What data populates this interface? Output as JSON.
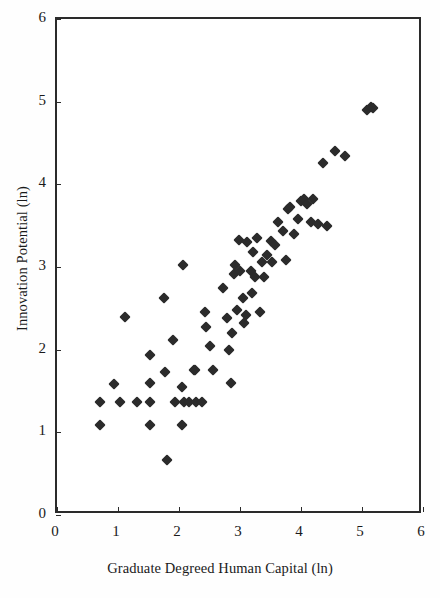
{
  "chart_data": {
    "type": "scatter",
    "title": "",
    "xlabel": "Graduate Degreed Human Capital (ln)",
    "ylabel": "Innovation Potential (ln)",
    "xlim": [
      0,
      6
    ],
    "ylim": [
      0,
      6
    ],
    "xticks": [
      0,
      1,
      2,
      3,
      4,
      5,
      6
    ],
    "yticks": [
      0,
      1,
      2,
      3,
      4,
      5,
      6
    ],
    "xtick_labels": [
      "0",
      "1",
      "2",
      "3",
      "4",
      "5",
      "6"
    ],
    "ytick_labels": [
      "0",
      "1",
      "2",
      "3",
      "4",
      "5",
      "6"
    ],
    "grid": false,
    "legend": null,
    "marker": "diamond",
    "marker_color": "#2b2b2b",
    "n_points": 74,
    "points": [
      [
        0.7,
        1.37
      ],
      [
        0.7,
        1.09
      ],
      [
        0.93,
        1.58
      ],
      [
        1.03,
        1.37
      ],
      [
        1.11,
        2.39
      ],
      [
        1.31,
        1.37
      ],
      [
        1.52,
        1.93
      ],
      [
        1.52,
        1.6
      ],
      [
        1.52,
        1.37
      ],
      [
        1.52,
        1.09
      ],
      [
        1.75,
        2.63
      ],
      [
        1.77,
        1.73
      ],
      [
        1.8,
        0.67
      ],
      [
        1.9,
        2.12
      ],
      [
        1.93,
        1.37
      ],
      [
        2.05,
        1.55
      ],
      [
        2.05,
        1.09
      ],
      [
        2.07,
        3.02
      ],
      [
        2.08,
        1.37
      ],
      [
        2.17,
        1.37
      ],
      [
        2.25,
        1.76
      ],
      [
        2.26,
        1.76
      ],
      [
        2.28,
        1.37
      ],
      [
        2.38,
        1.37
      ],
      [
        2.42,
        2.45
      ],
      [
        2.45,
        2.28
      ],
      [
        2.5,
        2.05
      ],
      [
        2.55,
        1.75
      ],
      [
        2.72,
        2.75
      ],
      [
        2.79,
        2.38
      ],
      [
        2.82,
        2.0
      ],
      [
        2.85,
        1.6
      ],
      [
        2.87,
        2.2
      ],
      [
        2.9,
        2.92
      ],
      [
        2.92,
        3.02
      ],
      [
        2.95,
        2.48
      ],
      [
        2.98,
        3.33
      ],
      [
        3.0,
        2.95
      ],
      [
        3.05,
        2.62
      ],
      [
        3.07,
        2.32
      ],
      [
        3.1,
        2.42
      ],
      [
        3.12,
        3.3
      ],
      [
        3.18,
        2.95
      ],
      [
        3.2,
        2.68
      ],
      [
        3.22,
        3.18
      ],
      [
        3.25,
        2.88
      ],
      [
        3.28,
        3.35
      ],
      [
        3.32,
        2.45
      ],
      [
        3.36,
        3.06
      ],
      [
        3.4,
        2.88
      ],
      [
        3.44,
        3.14
      ],
      [
        3.5,
        3.32
      ],
      [
        3.53,
        3.06
      ],
      [
        3.58,
        3.27
      ],
      [
        3.62,
        3.55
      ],
      [
        3.7,
        3.44
      ],
      [
        3.75,
        3.08
      ],
      [
        3.78,
        3.7
      ],
      [
        3.82,
        3.72
      ],
      [
        3.88,
        3.4
      ],
      [
        3.95,
        3.58
      ],
      [
        4.0,
        3.8
      ],
      [
        4.05,
        3.82
      ],
      [
        4.1,
        3.76
      ],
      [
        4.16,
        3.55
      ],
      [
        4.2,
        3.82
      ],
      [
        4.28,
        3.52
      ],
      [
        4.36,
        4.26
      ],
      [
        4.42,
        3.5
      ],
      [
        4.55,
        4.4
      ],
      [
        4.72,
        4.34
      ],
      [
        5.08,
        4.9
      ],
      [
        5.14,
        4.93
      ],
      [
        5.18,
        4.92
      ]
    ]
  },
  "axes": {
    "x_axis_label": "Graduate Degreed Human Capital (ln)",
    "y_axis_label": "Innovation Potential (ln)"
  },
  "colors": {
    "marker": "#2b2b2b",
    "frame": "#2b2b2b",
    "background": "#ffffff",
    "text": "#1a1a1a"
  }
}
